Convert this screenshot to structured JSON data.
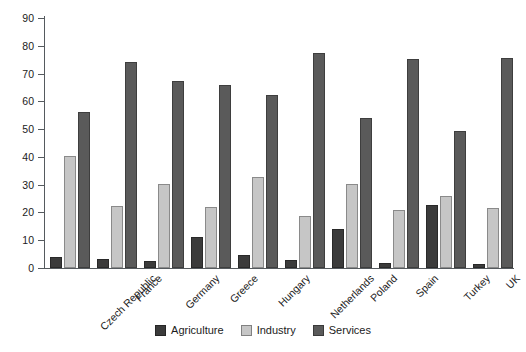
{
  "chart_data": {
    "type": "bar",
    "title": "",
    "subtitle": "",
    "xlabel": "",
    "ylabel": "",
    "ylim": [
      0,
      90
    ],
    "yticks": [
      0,
      10,
      20,
      30,
      40,
      50,
      60,
      70,
      80,
      90
    ],
    "grid": false,
    "legend_position": "bottom-center",
    "categories": [
      "Czech Republic",
      "France",
      "Germany",
      "Greece",
      "Hungary",
      "Netherlands",
      "Poland",
      "Spain",
      "Turkey",
      "UK"
    ],
    "series": [
      {
        "name": "Agriculture",
        "color": "#3b3b3b",
        "values": [
          3.8,
          3.2,
          2.4,
          11.3,
          4.7,
          2.8,
          14.2,
          1.9,
          22.7,
          1.3
        ]
      },
      {
        "name": "Industry",
        "color": "#c6c6c6",
        "values": [
          40.3,
          22.4,
          30.2,
          22.1,
          32.6,
          18.7,
          30.2,
          20.8,
          25.9,
          21.5
        ]
      },
      {
        "name": "Services",
        "color": "#5a5a5a",
        "values": [
          56.3,
          74.2,
          67.5,
          65.8,
          62.2,
          77.4,
          53.9,
          75.3,
          49.2,
          75.7
        ]
      }
    ]
  },
  "axis": {
    "tick_labels": [
      "0",
      "10",
      "20",
      "30",
      "40",
      "50",
      "60",
      "70",
      "80",
      "90"
    ]
  },
  "legend": {
    "items": [
      {
        "label": "Agriculture",
        "color": "#3b3b3b"
      },
      {
        "label": "Industry",
        "color": "#c6c6c6"
      },
      {
        "label": "Services",
        "color": "#5a5a5a"
      }
    ]
  },
  "colors": {
    "axis": "#555a5e",
    "text": "#1b1b1b",
    "background": "#ffffff",
    "agriculture": "#3b3b3b",
    "industry": "#c6c6c6",
    "services": "#5a5a5a"
  }
}
